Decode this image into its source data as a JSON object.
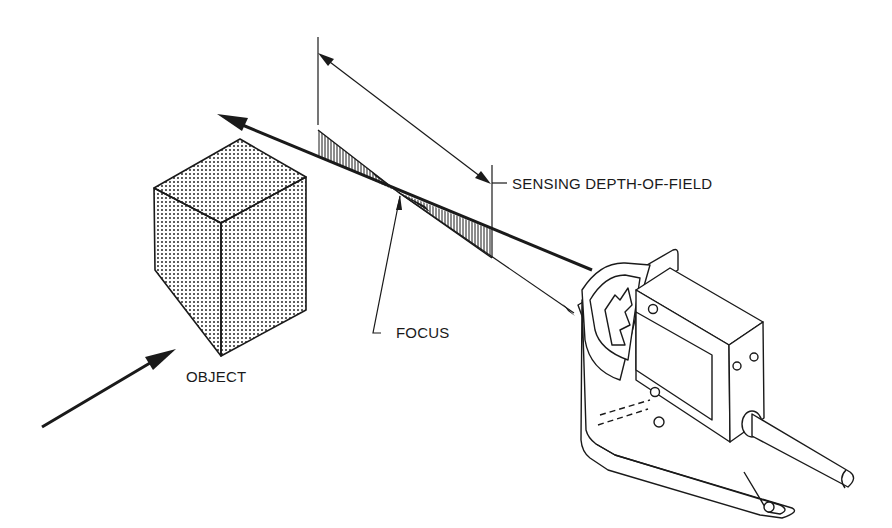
{
  "diagram": {
    "type": "technical-illustration",
    "labels": {
      "depth_of_field": "SENSING DEPTH-OF-FIELD",
      "focus": "FOCUS",
      "object": "OBJECT"
    },
    "colors": {
      "ink": "#1a1a1a",
      "background": "#ffffff"
    }
  }
}
